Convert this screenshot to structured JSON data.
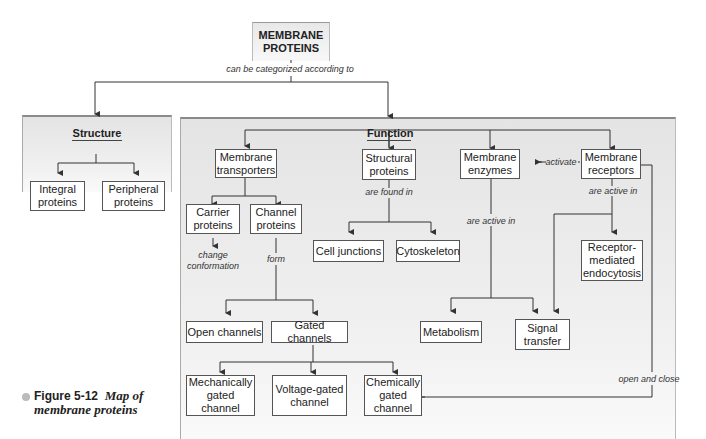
{
  "root": {
    "line1": "MEMBRANE",
    "line2": "PROTEINS"
  },
  "root_label": "can be categorized according to",
  "structure": {
    "heading": "Structure",
    "integral": [
      "Integral",
      "proteins"
    ],
    "peripheral": [
      "Peripheral",
      "proteins"
    ]
  },
  "function": {
    "heading": "Function",
    "transporters": [
      "Membrane",
      "transporters"
    ],
    "structural": [
      "Structural",
      "proteins"
    ],
    "enzymes": [
      "Membrane",
      "enzymes"
    ],
    "receptors": [
      "Membrane",
      "receptors"
    ],
    "carrier": [
      "Carrier",
      "proteins"
    ],
    "channel": [
      "Channel",
      "proteins"
    ],
    "cell_junctions": "Cell junctions",
    "cytoskeleton": "Cytoskeleton",
    "rme": [
      "Receptor-",
      "mediated",
      "endocytosis"
    ],
    "open_channels": "Open channels",
    "gated_channels": "Gated channels",
    "metabolism": "Metabolism",
    "signal": [
      "Signal",
      "transfer"
    ],
    "mech": [
      "Mechanically",
      "gated",
      "channel"
    ],
    "volt": [
      "Voltage-gated",
      "channel"
    ],
    "chem": [
      "Chemically",
      "gated",
      "channel"
    ]
  },
  "labels": {
    "activate": "activate",
    "are_found_in": "are found in",
    "enzymes_active_in": "are active in",
    "receptors_active_in": "are active in",
    "change_conf": [
      "change",
      "conformation"
    ],
    "form": "form",
    "open_close": "open and close"
  },
  "caption": {
    "figure": "Figure 5-12",
    "title_line1": "Map of",
    "title_line2": "membrane proteins"
  }
}
